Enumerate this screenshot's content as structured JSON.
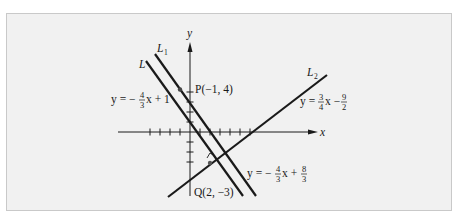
{
  "figure": {
    "axes": {
      "x_label": "x",
      "y_label": "y"
    },
    "lines": [
      {
        "name": "L",
        "label": "L",
        "subscript": "",
        "slope": "-4/3",
        "intercept": "1",
        "equation": {
          "prefix": "y = −",
          "num": "4",
          "den": "3",
          "suffix": "x + 1"
        }
      },
      {
        "name": "L1",
        "label": "L",
        "subscript": "1",
        "slope": "-4/3",
        "intercept": "8/3",
        "equation": {
          "prefix": "y = −",
          "num": "4",
          "den": "3",
          "mid": "x +",
          "num2": "8",
          "den2": "3"
        }
      },
      {
        "name": "L2",
        "label": "L",
        "subscript": "2",
        "slope": "3/4",
        "intercept": "-9/2",
        "equation": {
          "prefix": "y =",
          "num": "3",
          "den": "4",
          "mid": "x −",
          "num2": "9",
          "den2": "2"
        }
      }
    ],
    "points": [
      {
        "name": "P",
        "label": "P(−1, 4)",
        "x": -1,
        "y": 4
      },
      {
        "name": "Q",
        "label": "Q(2, −3)",
        "x": 2,
        "y": -3
      }
    ],
    "colors": {
      "background": "#f1f1f1",
      "border": "#c9c9c9",
      "ink": "#1a1a1a"
    }
  }
}
